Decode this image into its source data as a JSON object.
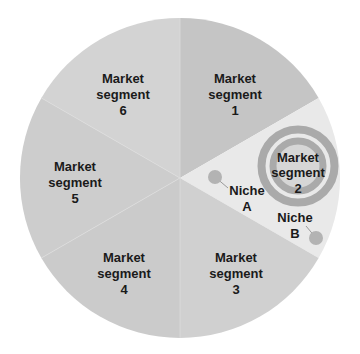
{
  "diagram": {
    "type": "segmented-pie-target",
    "center": [
      180,
      178
    ],
    "radius": 160,
    "segments": [
      {
        "id": 1,
        "line1": "Market",
        "line2": "segment",
        "line3": "1",
        "color": "#c5c5c5"
      },
      {
        "id": 2,
        "line1": "Market",
        "line2": "segment",
        "line3": "2",
        "color": "#e9e9e9",
        "targeted": true
      },
      {
        "id": 3,
        "line1": "Market",
        "line2": "segment",
        "line3": "3",
        "color": "#d0d0d0"
      },
      {
        "id": 4,
        "line1": "Market",
        "line2": "segment",
        "line3": "4",
        "color": "#cbcbcb"
      },
      {
        "id": 5,
        "line1": "Market",
        "line2": "segment",
        "line3": "5",
        "color": "#cdcdcd"
      },
      {
        "id": 6,
        "line1": "Market",
        "line2": "segment",
        "line3": "6",
        "color": "#d3d3d3"
      }
    ],
    "target": {
      "ring_color": "#aaaaaa",
      "center_color": "#d6d6d6"
    },
    "niches": [
      {
        "name": "Niche A",
        "line1": "Niche",
        "line2": "A",
        "dot_color": "#b3b3b3"
      },
      {
        "name": "Niche B",
        "line1": "Niche",
        "line2": "B",
        "dot_color": "#b3b3b3"
      }
    ]
  }
}
